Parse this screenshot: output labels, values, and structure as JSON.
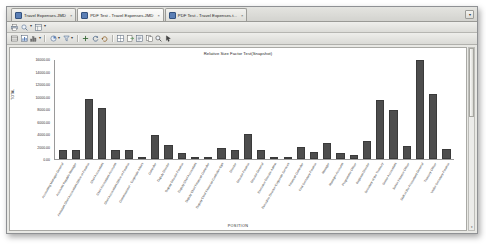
{
  "window": {
    "tabs": [
      {
        "label": "Travel Expenses.JMD",
        "active": false,
        "close": "×",
        "icon": "document-icon"
      },
      {
        "label": "PDF Test - Travel Expenses.JMD",
        "active": true,
        "close": "×",
        "icon": "document-icon"
      },
      {
        "label": "PDF Test - Travel Expenses.t...",
        "active": false,
        "close": "×",
        "icon": "document-icon"
      }
    ],
    "tabstrip_menu": "▾"
  },
  "toolbar_top": {
    "buttons": [
      {
        "name": "print-icon",
        "caret": false
      },
      {
        "name": "zoom-icon",
        "caret": true
      },
      {
        "name": "page-layout-icon",
        "caret": true
      }
    ]
  },
  "toolbar_main": {
    "buttons": [
      {
        "name": "table-icon",
        "caret": false
      },
      {
        "name": "chart-icon",
        "caret": false
      },
      {
        "name": "bar-chart-icon",
        "caret": true
      },
      {
        "name": "pie-chart-icon",
        "caret": true
      },
      {
        "name": "filter-icon",
        "caret": true
      },
      {
        "name": "add-icon",
        "caret": false
      },
      {
        "name": "refresh-icon",
        "caret": false
      },
      {
        "name": "undo-icon",
        "caret": false
      },
      {
        "name": "grid-icon",
        "caret": false
      },
      {
        "name": "export-icon",
        "caret": false
      },
      {
        "name": "properties-icon",
        "caret": false
      },
      {
        "name": "copy-icon",
        "caret": false
      },
      {
        "name": "search-icon",
        "caret": false
      },
      {
        "name": "pointer-icon",
        "caret": false
      }
    ]
  },
  "scrollbar": {
    "up_arrow": "▴",
    "down_arrow": "▾"
  },
  "chart_data": {
    "type": "bar",
    "title": "Relative Size Factor Test(Snapshot)",
    "xlabel": "POSITION",
    "ylabel": "TOTAL",
    "ylim": [
      0,
      16000
    ],
    "grid": true,
    "legend": false,
    "ytick_labels": [
      "16000.00",
      "14000.00",
      "12000.00",
      "10000.00",
      "8000.00",
      "6000.00",
      "4000.00",
      "2000.00",
      "0.00"
    ],
    "ytick_values": [
      16000,
      14000,
      12000,
      10000,
      8000,
      6000,
      4000,
      2000,
      0
    ],
    "categories": [
      "Accounting Manager-General",
      "Accounts Payable Manager",
      "Assistant Chief Accountant-Office of Finance",
      "Chief Accountant",
      "Chief Accountant-Accounts",
      "Chief Accountant-Office of Finance",
      "Commissioner - Corporate Affairs",
      "Controller",
      "Deputy Director",
      "Deputy Director-Finance",
      "Deputy Chief Accountant",
      "Deputy Chief Financial Controller",
      "Deputy Chief Financial Controller-Ops",
      "Director",
      "Director-Finance",
      "Director-General",
      "Executive Director-Admin",
      "Executive Director-Corporate Services",
      "Financial Controller",
      "First Secretary-Finance",
      "Manager",
      "Manager-Accounts",
      "Programme Officer",
      "Regional Director",
      "Secretary of the Treasury",
      "Senior Accountant",
      "Senior Finance Officer",
      "Staff of the Accountant-General",
      "Treasury Officer",
      "Under Secretary-Finance"
    ],
    "values": [
      1400,
      1500,
      9600,
      8200,
      1500,
      1400,
      100,
      3900,
      2200,
      950,
      400,
      300,
      1700,
      1400,
      4000,
      1500,
      300,
      0,
      2000,
      1200,
      2600,
      1000,
      600,
      2900,
      9400,
      7800,
      2100,
      15800,
      10400,
      1600
    ]
  }
}
